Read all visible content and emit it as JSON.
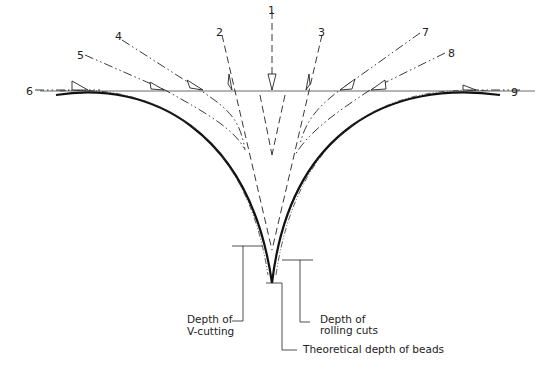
{
  "diagram": {
    "type": "bead-cutting cross-section",
    "tool_positions": [
      "1",
      "2",
      "3",
      "4",
      "5",
      "6",
      "7",
      "8",
      "9"
    ],
    "labels": {
      "depth_v_line1": "Depth of",
      "depth_v_line2": "V-cutting",
      "depth_roll_line1": "Depth of",
      "depth_roll_line2": "rolling cuts",
      "theoretical": "Theoretical depth of beads"
    },
    "colors": {
      "line": "#222222",
      "background": "#ffffff"
    }
  }
}
